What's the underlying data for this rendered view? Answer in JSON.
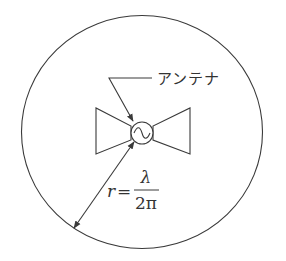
{
  "diagram": {
    "label_antenna": "アンテナ",
    "formula": {
      "lhs": "r",
      "equals": "=",
      "numerator": "λ",
      "denominator": "2π"
    },
    "colors": {
      "line": "#3a3a3a",
      "background": "#ffffff"
    }
  }
}
